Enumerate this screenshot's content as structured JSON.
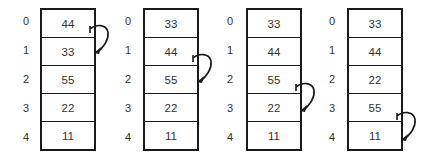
{
  "diagram": {
    "indices": [
      "0",
      "1",
      "2",
      "3",
      "4"
    ],
    "arrays": [
      {
        "values": [
          "44",
          "33",
          "55",
          "22",
          "11"
        ],
        "swap_from": 0,
        "swap_to": 1
      },
      {
        "values": [
          "33",
          "44",
          "55",
          "22",
          "11"
        ],
        "swap_from": 1,
        "swap_to": 2
      },
      {
        "values": [
          "33",
          "44",
          "55",
          "22",
          "11"
        ],
        "swap_from": 2,
        "swap_to": 3
      },
      {
        "values": [
          "33",
          "44",
          "22",
          "55",
          "11"
        ],
        "swap_from": 3,
        "swap_to": 4
      }
    ],
    "colors": {
      "stroke": "#1a1a1a",
      "text": "#333333",
      "background": "#ffffff"
    }
  }
}
